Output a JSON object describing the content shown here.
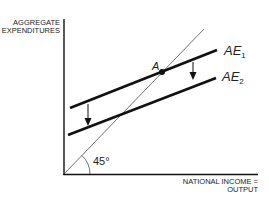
{
  "diagram": {
    "y_axis_label": [
      "AGGREGATE",
      "EXPENDITURES"
    ],
    "x_axis_label": [
      "NATIONAL INCOME =",
      "OUTPUT"
    ],
    "angle_label": "45°",
    "point_label": "A",
    "curves": [
      {
        "name": "AE",
        "subscript": "1"
      },
      {
        "name": "AE",
        "subscript": "2"
      }
    ],
    "colors": {
      "line": "#111111",
      "text": "#222222"
    }
  }
}
